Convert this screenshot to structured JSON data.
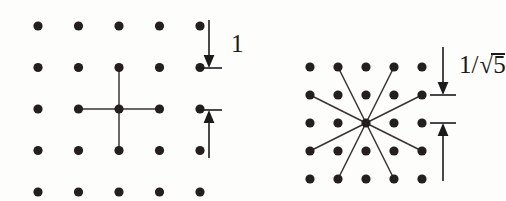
{
  "figure": {
    "background_color": "#fdfdfc",
    "dot_color": "#241f1c",
    "line_color": "#3a3430",
    "label_color": "#1b1b1b",
    "width": 504,
    "height": 201
  },
  "panels": [
    {
      "id": "left-panel",
      "name": "unit-spacing-lattice",
      "lattice": {
        "columns": 5,
        "rows": 5,
        "origin_x": 38,
        "origin_y": 26,
        "spacing_x": 40.5,
        "spacing_y": 41.5,
        "dot_radius": 4.6
      },
      "center_index": {
        "col": 2,
        "row": 2
      },
      "connections_label": "orthogonal-neighbors",
      "connection_offsets": [
        [
          1,
          0
        ],
        [
          -1,
          0
        ],
        [
          0,
          1
        ],
        [
          0,
          -1
        ]
      ],
      "annotation": {
        "name": "unit-distance-annotation",
        "label": "1",
        "axis_x": 209,
        "top_tick_y": 20,
        "upper_arrow_tip_y": 68,
        "lower_arrow_tip_y": 110,
        "bottom_tail_y": 158,
        "tick_half_width": 13
      }
    },
    {
      "id": "right-panel",
      "name": "scaled-lattice",
      "lattice": {
        "columns": 5,
        "rows": 5,
        "origin_x": 310,
        "origin_y": 67,
        "spacing_x": 28,
        "spacing_y": 28,
        "dot_radius": 4.6
      },
      "center_index": {
        "col": 2,
        "row": 2
      },
      "connections_label": "knight-move-neighbors",
      "connection_offsets": [
        [
          1,
          2
        ],
        [
          2,
          1
        ],
        [
          2,
          -1
        ],
        [
          1,
          -2
        ],
        [
          -1,
          -2
        ],
        [
          -2,
          -1
        ],
        [
          -2,
          1
        ],
        [
          -1,
          2
        ]
      ],
      "annotation": {
        "name": "inverse-sqrt-five-distance-annotation",
        "label_numerator": "1",
        "label_slash": "/",
        "label_radical": "√",
        "label_radicand": "5",
        "label_full": "1/√5",
        "axis_x": 443,
        "top_tick_y": 47,
        "upper_arrow_tip_y": 95,
        "lower_arrow_tip_y": 123,
        "bottom_tail_y": 181,
        "tick_half_width": 13
      }
    }
  ]
}
